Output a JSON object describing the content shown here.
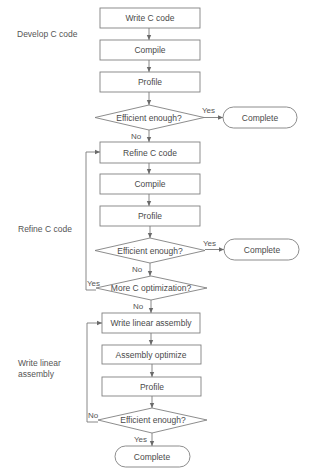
{
  "sections": {
    "develop": "Develop C code",
    "refine": "Refine C code",
    "linear_line1": "Write linear",
    "linear_line2": "assembly"
  },
  "nodes": {
    "write_c": "Write C code",
    "compile1": "Compile",
    "profile1": "Profile",
    "decision1": "Efficient enough?",
    "complete1": "Complete",
    "refine_c": "Refine C code",
    "compile2": "Compile",
    "profile2": "Profile",
    "decision2": "Efficient enough?",
    "complete2": "Complete",
    "decision3": "More C optimization?",
    "write_linear": "Write linear assembly",
    "asm_optimize": "Assembly optimize",
    "profile3": "Profile",
    "decision4": "Efficient enough?",
    "complete3": "Complete"
  },
  "edge_labels": {
    "d1_yes": "Yes",
    "d1_no": "No",
    "d2_yes": "Yes",
    "d2_no": "No",
    "d3_yes": "Yes",
    "d3_no": "No",
    "d4_no": "No",
    "d4_yes": "Yes"
  },
  "colors": {
    "line": "#7a7a7a",
    "text": "#4a4a4a",
    "background": "#ffffff"
  }
}
